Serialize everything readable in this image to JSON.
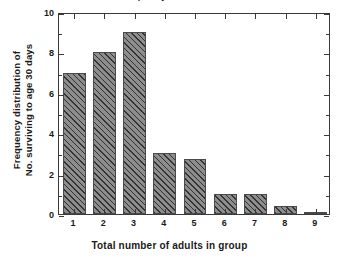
{
  "chart_data": {
    "type": "bar",
    "title": "Frequency distribution",
    "categories": [
      "1",
      "2",
      "3",
      "4",
      "5",
      "6",
      "7",
      "8",
      "9"
    ],
    "values": [
      7,
      8,
      9,
      3,
      2.7,
      1,
      1,
      0.4,
      0.1
    ],
    "xlabel": "Total number of adults in group",
    "ylabel_lines": [
      "Frequency distribution of",
      "No. surviving to age 30 days"
    ],
    "ylim": [
      0,
      10
    ],
    "y_major_ticks": [
      0,
      2,
      4,
      6,
      8,
      10
    ],
    "y_minor_ticks": [
      1,
      3,
      5,
      7,
      9
    ],
    "grid": false,
    "legend": null,
    "series_name": "Frequency",
    "bar_fill_color": "#8d8d8d",
    "bar_edge_color": "#4a4a4a",
    "bar_hatch": "diagonal-45",
    "axis_color": "#3a3a3a",
    "background_color": "#ffffff"
  }
}
